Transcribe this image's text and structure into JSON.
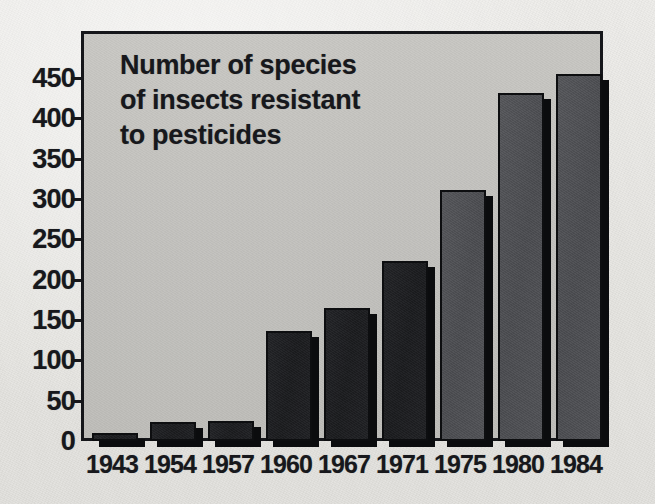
{
  "chart_data": {
    "type": "bar",
    "title": "Number of species of insects resistant to pesticides",
    "title_lines": [
      "Number of species",
      "of insects resistant",
      "to pesticides"
    ],
    "xlabel": "",
    "ylabel": "",
    "categories": [
      "1943",
      "1954",
      "1957",
      "1960",
      "1967",
      "1971",
      "1975",
      "1980",
      "1984"
    ],
    "values": [
      10,
      24,
      25,
      137,
      165,
      223,
      311,
      432,
      455
    ],
    "ylim": [
      0,
      470
    ],
    "yticks": [
      0,
      50,
      100,
      150,
      200,
      250,
      300,
      350,
      400,
      450
    ],
    "ytick_labels": [
      "0",
      "50",
      "100",
      "150",
      "200",
      "250",
      "300",
      "350",
      "400",
      "450"
    ],
    "grid": false,
    "legend": "none",
    "bar_colors": [
      "#1e1f22",
      "#1e1f22",
      "#1e1f22",
      "#1e1f22",
      "#1e1f22",
      "#2c2d30",
      "#3d3e42",
      "#4e4f53",
      "#55565a"
    ],
    "bar_shades": [
      "dark",
      "dark",
      "dark",
      "dark",
      "dark",
      "dark",
      "mid",
      "mid",
      "mid"
    ]
  },
  "colors": {
    "paper": "#e9e8e4",
    "plot_background": "#c4c3bf",
    "frame": "#15161a",
    "text": "#17181c",
    "bar_dark": "#1e1f22",
    "bar_mid": "#51525 6"
  }
}
